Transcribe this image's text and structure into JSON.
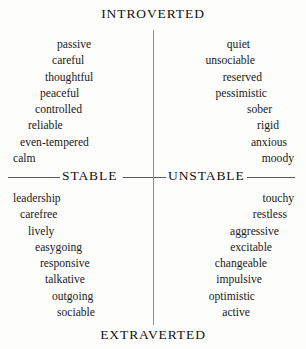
{
  "figure": {
    "poles": {
      "top": "INTROVERTED",
      "bottom": "EXTRAVERTED",
      "left": "STABLE",
      "right": "UNSTABLE"
    },
    "colors": {
      "background": "#fdfdfb",
      "text": "#1a1a1a",
      "axis_vertical": "#8d8d8d",
      "axis_horizontal": "#5a5a5a"
    }
  },
  "chart_data": {
    "type": "scatter",
    "title": "",
    "xlabel": "",
    "ylabel": "",
    "layout": "four-quadrant circumplex with words arranged along a circular arc",
    "axes": [
      {
        "name": "vertical",
        "negative_pole": "EXTRAVERTED",
        "positive_pole": "INTROVERTED"
      },
      {
        "name": "horizontal",
        "negative_pole": "STABLE",
        "positive_pole": "UNSTABLE"
      }
    ],
    "quadrants": [
      {
        "id": "upper-left",
        "name": "INTROVERTED / STABLE",
        "align": "left",
        "words": [
          "passive",
          "careful",
          "thoughtful",
          "peaceful",
          "controlled",
          "reliable",
          "even-tempered",
          "calm"
        ],
        "offsets": [
          53,
          48,
          41,
          36,
          31,
          24,
          16,
          9
        ]
      },
      {
        "id": "upper-right",
        "name": "INTROVERTED / UNSTABLE",
        "align": "right",
        "words": [
          "quiet",
          "unsociable",
          "reserved",
          "pessimistic",
          "sober",
          "rigid",
          "anxious",
          "moody"
        ],
        "offsets": [
          53,
          48,
          41,
          36,
          31,
          24,
          16,
          9
        ]
      },
      {
        "id": "lower-left",
        "name": "EXTRAVERTED / STABLE",
        "align": "left",
        "words": [
          "leadership",
          "carefree",
          "lively",
          "easygoing",
          "responsive",
          "talkative",
          "outgoing",
          "sociable"
        ],
        "offsets": [
          9,
          16,
          24,
          31,
          36,
          41,
          48,
          53
        ]
      },
      {
        "id": "lower-right",
        "name": "EXTRAVERTED / UNSTABLE",
        "align": "right",
        "words": [
          "touchy",
          "restless",
          "aggressive",
          "excitable",
          "changeable",
          "impulsive",
          "optimistic",
          "active"
        ],
        "offsets": [
          9,
          16,
          24,
          31,
          36,
          41,
          48,
          53
        ]
      }
    ]
  }
}
